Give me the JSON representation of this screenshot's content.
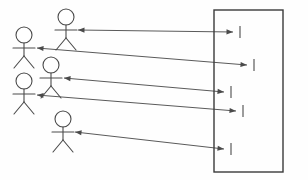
{
  "diagram": {
    "type": "uml-actor-system-diagram",
    "background_color": "#fefefe",
    "line_color": "#5a5a5a",
    "actor_color": "#4a4a4a",
    "boundary_color": "#3a3a3a",
    "canvas": {
      "width": 308,
      "height": 180
    }
  },
  "actors": [
    {
      "id": "actor-1",
      "name": "actor-top",
      "label": "",
      "head_cx": 66,
      "head_cy": 17,
      "head_r": 8,
      "body_top_y": 25,
      "body_bottom_y": 38,
      "arm_y": 30,
      "arm_left_x": 55,
      "arm_right_x": 77,
      "leg_left_x": 56,
      "leg_right_x": 76,
      "leg_y": 50
    },
    {
      "id": "actor-2",
      "name": "actor-upper-left",
      "label": "",
      "head_cx": 24,
      "head_cy": 35,
      "head_r": 8,
      "body_top_y": 43,
      "body_bottom_y": 56,
      "arm_y": 48,
      "arm_left_x": 13,
      "arm_right_x": 35,
      "leg_left_x": 14,
      "leg_right_x": 34,
      "leg_y": 68
    },
    {
      "id": "actor-3",
      "name": "actor-middle",
      "label": "",
      "head_cx": 51,
      "head_cy": 65,
      "head_r": 8,
      "body_top_y": 73,
      "body_bottom_y": 86,
      "arm_y": 78,
      "arm_left_x": 40,
      "arm_right_x": 62,
      "leg_left_x": 41,
      "leg_right_x": 61,
      "leg_y": 98
    },
    {
      "id": "actor-4",
      "name": "actor-lower-left",
      "label": "",
      "head_cx": 24,
      "head_cy": 81,
      "head_r": 8,
      "body_top_y": 89,
      "body_bottom_y": 102,
      "arm_y": 94,
      "arm_left_x": 13,
      "arm_right_x": 35,
      "leg_left_x": 14,
      "leg_right_x": 34,
      "leg_y": 114
    },
    {
      "id": "actor-5",
      "name": "actor-bottom",
      "label": "",
      "head_cx": 63,
      "head_cy": 119,
      "head_r": 8,
      "body_top_y": 127,
      "body_bottom_y": 140,
      "arm_y": 132,
      "arm_left_x": 52,
      "arm_right_x": 74,
      "leg_left_x": 53,
      "leg_right_x": 73,
      "leg_y": 152
    }
  ],
  "boundary": {
    "id": "system-boundary",
    "name": "system-boundary-rect",
    "label": "",
    "x": 214,
    "y": 10,
    "width": 69,
    "height": 162
  },
  "connectors": [
    {
      "id": "connector-1",
      "name": "connector-actor1-to-system",
      "label": "",
      "from_x": 78,
      "from_y": 30,
      "to_x": 233,
      "to_y": 32,
      "bidirectional": true,
      "tick_x": 240,
      "tick_y": 32,
      "tick_half_height": 6
    },
    {
      "id": "connector-2",
      "name": "connector-actor2-to-system",
      "label": "",
      "from_x": 37,
      "from_y": 48,
      "to_x": 247,
      "to_y": 65,
      "bidirectional": true,
      "tick_x": 254,
      "tick_y": 65,
      "tick_half_height": 6
    },
    {
      "id": "connector-3",
      "name": "connector-actor3-to-system",
      "label": "",
      "from_x": 64,
      "from_y": 78,
      "to_x": 224,
      "to_y": 92,
      "bidirectional": true,
      "tick_x": 231,
      "tick_y": 92,
      "tick_half_height": 6
    },
    {
      "id": "connector-4",
      "name": "connector-actor4-to-system",
      "label": "",
      "from_x": 37,
      "from_y": 95,
      "to_x": 236,
      "to_y": 111,
      "bidirectional": true,
      "tick_x": 243,
      "tick_y": 111,
      "tick_half_height": 6
    },
    {
      "id": "connector-5",
      "name": "connector-actor5-to-system",
      "label": "",
      "from_x": 75,
      "from_y": 132,
      "to_x": 224,
      "to_y": 149,
      "bidirectional": true,
      "tick_x": 231,
      "tick_y": 149,
      "tick_half_height": 6
    }
  ]
}
